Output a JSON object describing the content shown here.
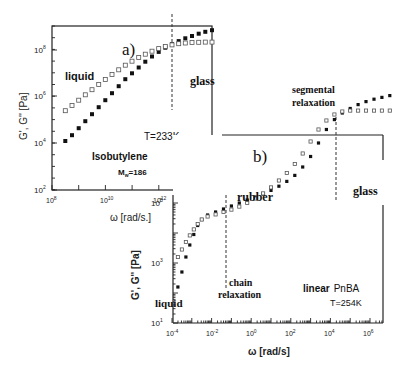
{
  "chart_data": [
    {
      "id": "a",
      "type": "scatter",
      "panel_label": "a)",
      "title": "",
      "xlabel": "ω [rad/s.]",
      "ylabel": "G', G'' [Pa]",
      "xscale": "log",
      "yscale": "log",
      "xlim_log10": [
        8,
        14
      ],
      "ylim_log10": [
        2,
        9
      ],
      "xticks": [
        "10^8",
        "10^10",
        "10^12",
        "10^14"
      ],
      "yticks": [
        "10^2",
        "10^4",
        "10^6",
        "10^8"
      ],
      "grid": false,
      "annotations": [
        "liquid",
        "glass",
        "T=233K",
        "Isobutylene",
        "M_w=186"
      ],
      "vline_log10": 12.5,
      "series": [
        {
          "name": "G' (storage, filled squares)",
          "marker": "filled-square",
          "x_log10": [
            8.5,
            8.75,
            9.0,
            9.25,
            9.5,
            9.75,
            10.0,
            10.25,
            10.5,
            10.75,
            11.0,
            11.25,
            11.5,
            11.75,
            12.0,
            12.25,
            12.5,
            12.75,
            13.0,
            13.25,
            13.5,
            13.75,
            14.0
          ],
          "y_log10": [
            4.1,
            4.35,
            4.65,
            4.95,
            5.25,
            5.55,
            5.85,
            6.15,
            6.45,
            6.75,
            7.0,
            7.25,
            7.5,
            7.72,
            7.92,
            8.1,
            8.25,
            8.38,
            8.5,
            8.6,
            8.7,
            8.78,
            8.85
          ]
        },
        {
          "name": "G'' (loss, open squares)",
          "marker": "open-square",
          "x_log10": [
            8.5,
            8.75,
            9.0,
            9.25,
            9.5,
            9.75,
            10.0,
            10.25,
            10.5,
            10.75,
            11.0,
            11.25,
            11.5,
            11.75,
            12.0,
            12.25,
            12.5,
            12.75,
            13.0,
            13.25,
            13.5,
            13.75,
            14.0
          ],
          "y_log10": [
            5.4,
            5.62,
            5.85,
            6.08,
            6.3,
            6.52,
            6.74,
            6.95,
            7.15,
            7.35,
            7.52,
            7.68,
            7.82,
            7.95,
            8.06,
            8.15,
            8.22,
            8.27,
            8.3,
            8.32,
            8.33,
            8.34,
            8.34
          ]
        }
      ]
    },
    {
      "id": "b",
      "type": "scatter",
      "panel_label": "b)",
      "title": "",
      "xlabel": "ω [rad/s]",
      "ylabel": "G', G'' [Pa]",
      "xscale": "log",
      "yscale": "log",
      "xlim_log10": [
        -4,
        7.3
      ],
      "ylim_log10": [
        1,
        9
      ],
      "xticks": [
        "10^-4",
        "10^-2",
        "10^0",
        "10^2",
        "10^4",
        "10^6"
      ],
      "yticks": [
        "10^1",
        "10^3",
        "10^5"
      ],
      "grid": false,
      "annotations": [
        "liquid",
        "rubber",
        "glass",
        "chain relaxation",
        "segmental relaxation",
        "linear PnBA",
        "T=254K"
      ],
      "vlines_log10": [
        -2.6,
        4.0
      ],
      "series": [
        {
          "name": "G' (storage, filled squares)",
          "marker": "filled-square",
          "x_log10": [
            -3.7,
            -3.5,
            -3.3,
            -3.1,
            -2.9,
            -2.7,
            -2.5,
            -2.2,
            -1.8,
            -1.4,
            -1.0,
            -0.6,
            -0.2,
            0.2,
            0.6,
            1.0,
            1.4,
            1.8,
            2.2,
            2.6,
            3.0,
            3.4,
            3.8,
            4.2,
            4.6,
            5.0,
            5.4,
            5.8,
            6.2,
            6.6,
            7.0
          ],
          "y_log10": [
            2.2,
            2.7,
            3.2,
            3.6,
            3.95,
            4.25,
            4.45,
            4.6,
            4.7,
            4.8,
            4.9,
            5.0,
            5.1,
            5.2,
            5.3,
            5.42,
            5.56,
            5.72,
            5.92,
            6.2,
            6.55,
            7.0,
            7.45,
            7.78,
            8.0,
            8.15,
            8.28,
            8.38,
            8.46,
            8.52,
            8.58
          ]
        },
        {
          "name": "G'' (loss, open squares)",
          "marker": "open-square",
          "x_log10": [
            -3.7,
            -3.5,
            -3.3,
            -3.1,
            -2.9,
            -2.7,
            -2.5,
            -2.2,
            -1.8,
            -1.4,
            -1.0,
            -0.6,
            -0.2,
            0.2,
            0.6,
            1.0,
            1.4,
            1.8,
            2.2,
            2.6,
            3.0,
            3.4,
            3.8,
            4.2,
            4.6,
            5.0,
            5.4,
            5.8,
            6.2,
            6.6,
            7.0
          ],
          "y_log10": [
            3.2,
            3.45,
            3.7,
            3.92,
            4.12,
            4.3,
            4.45,
            4.55,
            4.62,
            4.7,
            4.78,
            4.88,
            5.0,
            5.15,
            5.32,
            5.52,
            5.75,
            6.0,
            6.3,
            6.65,
            7.05,
            7.45,
            7.75,
            7.95,
            8.05,
            8.08,
            8.08,
            8.08,
            8.08,
            8.08,
            8.08
          ]
        }
      ]
    }
  ],
  "labels": {
    "a": {
      "panel": "a)",
      "liquid": "liquid",
      "glass": "glass",
      "temp": "T=233K",
      "material": "Isobutylene",
      "mw_prefix": "M",
      "mw_sub": "w",
      "mw_value": "=186",
      "xlabel": "ω [rad/s.]",
      "ylabel": "G', G'' [Pa]",
      "xtick_base": [
        "10",
        "10",
        "10",
        "10"
      ],
      "xtick_exp": [
        "8",
        "10",
        "12",
        "14"
      ],
      "ytick_base": [
        "10",
        "10",
        "10",
        "10"
      ],
      "ytick_exp": [
        "2",
        "4",
        "6",
        "8"
      ]
    },
    "b": {
      "panel": "b)",
      "liquid": "liquid",
      "rubber": "rubber",
      "glass": "glass",
      "chain1": "chain",
      "chain2": "relaxation",
      "seg1": "segmental",
      "seg2": "relaxation",
      "material_bold": "linear",
      "material": "PnBA",
      "temp": "T=254K",
      "xlabel": "ω [rad/s]",
      "ylabel": "G', G'' [Pa]",
      "xtick_base": [
        "10",
        "10",
        "10",
        "10",
        "10",
        "10"
      ],
      "xtick_exp": [
        "-4",
        "-2",
        "0",
        "2",
        "4",
        "6"
      ],
      "ytick_base": [
        "10",
        "10",
        "10"
      ],
      "ytick_exp": [
        "1",
        "3",
        "5"
      ]
    }
  },
  "colors": {
    "ink": "#111111",
    "axis": "#222222",
    "background": "#ffffff"
  }
}
